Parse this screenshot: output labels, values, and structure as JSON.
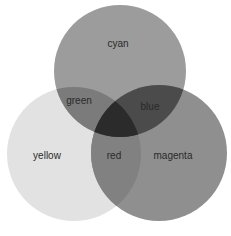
{
  "diagram": {
    "type": "venn-3",
    "background": "#ffffff",
    "circles": [
      {
        "id": "cyan",
        "label": "cyan",
        "cx": 120,
        "cy": 71,
        "r": 66,
        "fill": "#9c9c9c"
      },
      {
        "id": "yellow",
        "label": "yellow",
        "cx": 74,
        "cy": 154,
        "r": 67,
        "fill": "#e2e2e2"
      },
      {
        "id": "magenta",
        "label": "magenta",
        "cx": 159,
        "cy": 153,
        "r": 68,
        "fill": "#8f8f8f"
      }
    ],
    "intersections": [
      {
        "id": "green",
        "label": "green",
        "sets": [
          "cyan",
          "yellow"
        ],
        "fill": "#7b7b7b"
      },
      {
        "id": "blue",
        "label": "blue",
        "sets": [
          "cyan",
          "magenta"
        ],
        "fill": "#4b4b4b"
      },
      {
        "id": "red",
        "label": "red",
        "sets": [
          "yellow",
          "magenta"
        ],
        "fill": "#818181"
      },
      {
        "id": "center",
        "label": "",
        "sets": [
          "cyan",
          "yellow",
          "magenta"
        ],
        "fill": "#2b2b2b"
      }
    ],
    "labels": {
      "cyan": "cyan",
      "yellow": "yellow",
      "magenta": "magenta",
      "green": "green",
      "blue": "blue",
      "red": "red"
    },
    "label_positions": {
      "cyan": [
        118,
        44
      ],
      "yellow": [
        47,
        156
      ],
      "magenta": [
        173,
        156
      ],
      "green": [
        79,
        101
      ],
      "blue": [
        150,
        107
      ],
      "red": [
        114,
        156
      ]
    }
  }
}
